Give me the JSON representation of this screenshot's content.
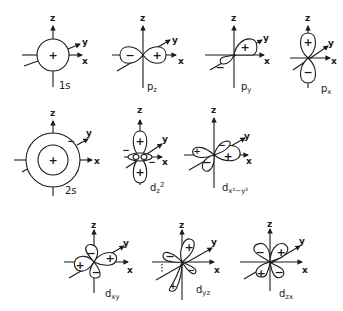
{
  "figure": {
    "axis_labels": {
      "z": "z",
      "y": "y",
      "x": "x"
    },
    "signs": {
      "plus": "+",
      "minus": "−"
    },
    "colors": {
      "ink": "#1a1a1a",
      "background": "#ffffff"
    },
    "orbitals": [
      {
        "id": "1s",
        "name_main": "1s",
        "name_sub": "",
        "name_sup": ""
      },
      {
        "id": "pz",
        "name_main": "p",
        "name_sub": "z",
        "name_sup": ""
      },
      {
        "id": "py",
        "name_main": "p",
        "name_sub": "y",
        "name_sup": ""
      },
      {
        "id": "px",
        "name_main": "p",
        "name_sub": "x",
        "name_sup": ""
      },
      {
        "id": "2s",
        "name_main": "2s",
        "name_sub": "",
        "name_sup": ""
      },
      {
        "id": "dz2",
        "name_main": "d",
        "name_sub": "z",
        "name_sup": "2"
      },
      {
        "id": "dx2y2",
        "name_main": "d",
        "name_sub": "x²−y²",
        "name_sup": ""
      },
      {
        "id": "dxy",
        "name_main": "d",
        "name_sub": "xy",
        "name_sup": ""
      },
      {
        "id": "dyz",
        "name_main": "d",
        "name_sub": "yz",
        "name_sup": ""
      },
      {
        "id": "dzx",
        "name_main": "d",
        "name_sub": "zx",
        "name_sup": ""
      }
    ]
  }
}
